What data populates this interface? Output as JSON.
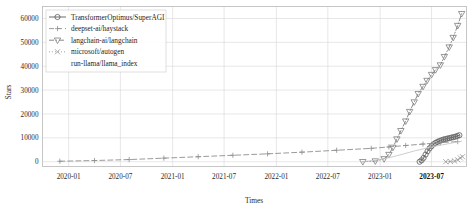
{
  "chart_data": {
    "type": "line",
    "title": "",
    "xlabel": "Times",
    "ylabel": "Stars",
    "grid": true,
    "legend_position": "upper-left",
    "ylim": [
      -2000,
      65000
    ],
    "yticks": [
      0,
      10000,
      20000,
      30000,
      40000,
      50000,
      60000
    ],
    "ytick_labels": [
      "0",
      "10000",
      "20000",
      "30000",
      "40000",
      "50000",
      "60000"
    ],
    "xticks": [
      "2020-01",
      "2020-07",
      "2021-01",
      "2021-07",
      "2022-01",
      "2022-07",
      "2023-01",
      "2023-07"
    ],
    "xtick_labels": [
      "2020-01",
      "2020-07",
      "2021-01",
      "2021-07",
      "2022-01",
      "2022-07",
      "2023-01",
      "2023-07"
    ],
    "xtick_highlight": "2023-07",
    "xlim": [
      "2019-10",
      "2023-11"
    ],
    "series": [
      {
        "name": "TransformerOptimus/SuperAGI",
        "marker": "circle",
        "linestyle": "solid",
        "color": "#5a5a5a",
        "x": [
          "2023-05-20",
          "2023-05-27",
          "2023-06-03",
          "2023-06-10",
          "2023-06-17",
          "2023-06-24",
          "2023-07-01",
          "2023-07-08",
          "2023-07-15",
          "2023-07-22",
          "2023-07-29",
          "2023-08-05",
          "2023-08-12",
          "2023-08-19",
          "2023-08-26",
          "2023-09-02",
          "2023-09-09",
          "2023-09-16",
          "2023-09-23",
          "2023-09-30",
          "2023-10-07"
        ],
        "y": [
          0,
          600,
          1600,
          3000,
          4400,
          5600,
          6500,
          7300,
          7900,
          8300,
          8700,
          9000,
          9300,
          9500,
          9700,
          9900,
          10100,
          10300,
          10500,
          10800,
          11100
        ]
      },
      {
        "name": "deepset-ai/haystack",
        "marker": "plus",
        "linestyle": "dashed",
        "color": "#8f8f8f",
        "x": [
          "2019-12-01",
          "2020-04-01",
          "2020-08-01",
          "2020-12-01",
          "2021-04-01",
          "2021-08-01",
          "2021-12-01",
          "2022-04-01",
          "2022-08-01",
          "2022-12-01",
          "2023-02-01",
          "2023-04-01",
          "2023-06-01",
          "2023-08-01",
          "2023-10-01"
        ],
        "y": [
          200,
          500,
          900,
          1500,
          2100,
          2700,
          3300,
          4000,
          4800,
          5600,
          6200,
          6800,
          7400,
          8000,
          8400
        ]
      },
      {
        "name": "langchain-ai/langchain",
        "marker": "triangle-down",
        "linestyle": "dashdot",
        "color": "#7d7d7d",
        "x": [
          "2022-11-01",
          "2022-12-15",
          "2023-01-15",
          "2023-02-01",
          "2023-02-15",
          "2023-03-01",
          "2023-03-15",
          "2023-04-01",
          "2023-04-15",
          "2023-05-01",
          "2023-05-15",
          "2023-06-01",
          "2023-06-15",
          "2023-07-01",
          "2023-07-15",
          "2023-08-01",
          "2023-08-15",
          "2023-09-01",
          "2023-09-15",
          "2023-10-01",
          "2023-10-15"
        ],
        "y": [
          0,
          300,
          1200,
          3000,
          6000,
          9500,
          13000,
          17000,
          21000,
          25000,
          28500,
          31500,
          34000,
          36500,
          38500,
          40500,
          44000,
          48000,
          52000,
          57000,
          62000
        ]
      },
      {
        "name": "microsoft/autogen",
        "marker": "x",
        "linestyle": "dotted",
        "color": "#9a9a9a",
        "x": [
          "2023-08-20",
          "2023-09-05",
          "2023-09-20",
          "2023-10-01",
          "2023-10-10",
          "2023-10-18"
        ],
        "y": [
          0,
          100,
          300,
          800,
          1600,
          2100
        ]
      },
      {
        "name": "run-llama/llama_index",
        "marker": "none",
        "linestyle": "solid",
        "color": "#c7c7c7",
        "x": [
          "2022-11-01",
          "2023-01-01",
          "2023-03-01",
          "2023-05-01",
          "2023-07-01",
          "2023-09-01",
          "2023-10-15"
        ],
        "y": [
          0,
          800,
          2500,
          4500,
          6200,
          7600,
          8600
        ]
      }
    ]
  },
  "legend": {
    "items": [
      {
        "label": "TransformerOptimus/SuperAGI",
        "marker": "circle-marker"
      },
      {
        "label": "deepset-ai/haystack",
        "marker": "plus-marker"
      },
      {
        "label": "langchain-ai/langchain",
        "marker": "triangle-down-marker"
      },
      {
        "label": "microsoft/autogen",
        "marker": "x-marker"
      },
      {
        "label": "run-llama/llama_index",
        "marker": "none-marker"
      }
    ]
  }
}
